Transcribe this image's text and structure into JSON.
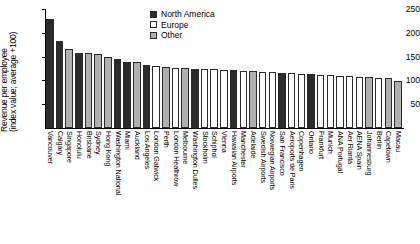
{
  "chart_data": {
    "type": "bar",
    "title": "",
    "xlabel": "",
    "ylabel": "Revenue per employee (index value; average +100)",
    "ylabel_line1": "Revenue per employee",
    "ylabel_line2": "(index value; average +100)",
    "ylim": [
      0,
      250
    ],
    "yticks": [
      0,
      50,
      100,
      150,
      200,
      250
    ],
    "ytick_labels": [
      "",
      "50",
      "100",
      "150",
      "200",
      "250"
    ],
    "grid": false,
    "legend_position": "top-center",
    "legend": [
      {
        "label": "North America",
        "color": "#2b2b2b"
      },
      {
        "label": "Europe",
        "color": "#ffffff"
      },
      {
        "label": "Other",
        "color": "#b0b0b0"
      }
    ],
    "categories": [
      "Vancouver",
      "Calgary",
      "Singapore",
      "Honolulu",
      "Brisbane",
      "Sydney",
      "Hong Kong",
      "Washington National",
      "Miami",
      "Auckland",
      "Los Angeles",
      "London Gatwick",
      "Perth",
      "London Heathrow",
      "Melbourne",
      "Washington Dulles",
      "Stockholm",
      "Schiphol",
      "Vienna",
      "Hawaiian Airports",
      "Manchester",
      "Adelaide",
      "Swedish Airports",
      "Norwegian Airports",
      "San Francisco",
      "Aeroports de Paris",
      "Copenhagen",
      "Ontario",
      "Frankfurt",
      "Munich",
      "ANA Portugal",
      "Aer Rianta",
      "AENA Spain",
      "Johannesburg",
      "Berlin",
      "Capetown",
      "Macau"
    ],
    "groups": [
      "North America",
      "North America",
      "Other",
      "North America",
      "Other",
      "Other",
      "Other",
      "North America",
      "North America",
      "Other",
      "North America",
      "Europe",
      "Other",
      "Europe",
      "Other",
      "North America",
      "Europe",
      "Europe",
      "Europe",
      "North America",
      "Europe",
      "Other",
      "Europe",
      "Europe",
      "North America",
      "Europe",
      "Europe",
      "North America",
      "Europe",
      "Europe",
      "Europe",
      "Europe",
      "Europe",
      "Other",
      "Europe",
      "Other",
      "Other"
    ],
    "values": [
      230,
      183,
      165,
      158,
      157,
      156,
      149,
      144,
      138,
      138,
      133,
      130,
      128,
      127,
      126,
      125,
      124,
      123,
      122,
      121,
      120,
      119,
      118,
      117,
      116,
      115,
      114,
      113,
      112,
      111,
      110,
      109,
      108,
      107,
      106,
      105,
      98
    ],
    "colors": {
      "north_america": "#2b2b2b",
      "europe": "#ffffff",
      "other": "#b0b0b0",
      "axis": "#000000"
    }
  }
}
